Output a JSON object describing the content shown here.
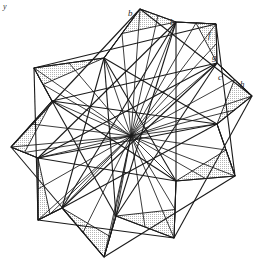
{
  "figure": {
    "name": "nine-pointed-star-polygon-diagram",
    "center": {
      "x": 131,
      "y": 136
    },
    "outer_radius": 128,
    "inner_radius": 88,
    "points": 9,
    "rotation_deg": -86,
    "colors": {
      "stroke": "#1a1a1a",
      "fill_light": "#d8d8d8",
      "fill_dark": "#9a9a9a",
      "background": "#ffffff",
      "label": "#2b2b2b"
    },
    "stroke_width": 1.1,
    "ray_stroke_width": 0.85,
    "corner_mark": "y"
  },
  "labels": [
    {
      "id": "label-b-1",
      "text": "b",
      "x": 128,
      "y": 16
    },
    {
      "id": "label-b-2",
      "text": "b",
      "x": 170,
      "y": 25
    },
    {
      "id": "label-f",
      "text": "f",
      "x": 208,
      "y": 38
    },
    {
      "id": "label-g",
      "text": "g",
      "x": 212,
      "y": 60
    },
    {
      "id": "label-c",
      "text": "c",
      "x": 218,
      "y": 80
    },
    {
      "id": "label-h",
      "text": "h",
      "x": 240,
      "y": 87
    }
  ],
  "chart_data": {
    "type": "scatter",
    "title": "",
    "xlabel": "",
    "ylabel": "",
    "series": [
      {
        "name": "outer-star-vertices",
        "x": [
          140,
          216,
          252,
          235,
          174,
          104,
          38,
          11,
          34
        ],
        "y": [
          9,
          24,
          96,
          176,
          238,
          257,
          220,
          147,
          68
        ]
      },
      {
        "name": "inner-star-vertices",
        "x": [
          176,
          217,
          217,
          176,
          116,
          62,
          38,
          52,
          104
        ],
        "y": [
          22,
          63,
          124,
          181,
          216,
          208,
          158,
          101,
          58
        ]
      }
    ],
    "annotations": [
      "b",
      "b",
      "f",
      "g",
      "c",
      "h"
    ],
    "grid": false,
    "legend": "none"
  }
}
